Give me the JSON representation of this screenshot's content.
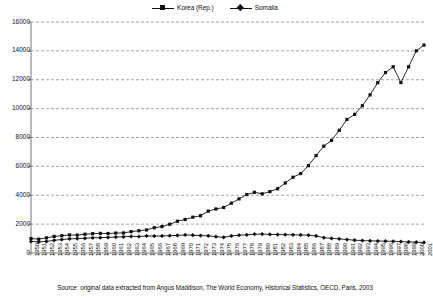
{
  "legend": {
    "position": "top-center",
    "entries": [
      {
        "label": "Korea (Rep.)",
        "marker": "square",
        "color": "#111111"
      },
      {
        "label": "Somalia",
        "marker": "diamond",
        "color": "#111111"
      }
    ]
  },
  "source_note": "Source: original data extracted from Angus Maddison, The World Economy, Historical Statistics, OECD, Paris, 2003",
  "axes": {
    "y_ticks": [
      "0",
      "2000",
      "4000",
      "6000",
      "8000",
      "10000",
      "12000",
      "14000",
      "16000"
    ],
    "x_first": "1950",
    "x_last": "2001"
  },
  "chart_data": {
    "type": "line",
    "title": "",
    "xlabel": "",
    "ylabel": "",
    "ylim": [
      0,
      16000
    ],
    "ytick_step": 2000,
    "grid": true,
    "legend_position": "top-center",
    "x": [
      1950,
      1951,
      1952,
      1953,
      1954,
      1955,
      1956,
      1957,
      1958,
      1959,
      1960,
      1961,
      1962,
      1963,
      1964,
      1965,
      1966,
      1967,
      1968,
      1969,
      1970,
      1971,
      1972,
      1973,
      1974,
      1975,
      1976,
      1977,
      1978,
      1979,
      1980,
      1981,
      1982,
      1983,
      1984,
      1985,
      1986,
      1987,
      1988,
      1989,
      1990,
      1991,
      1992,
      1993,
      1994,
      1995,
      1996,
      1997,
      1998,
      1999,
      2000,
      2001
    ],
    "series": [
      {
        "name": "Korea (Rep.)",
        "marker": "square",
        "color": "#111111",
        "values": [
          1000,
          960,
          1050,
          1150,
          1200,
          1250,
          1240,
          1300,
          1340,
          1360,
          1350,
          1380,
          1390,
          1480,
          1540,
          1600,
          1750,
          1830,
          1990,
          2200,
          2320,
          2480,
          2580,
          2900,
          3050,
          3150,
          3450,
          3750,
          4050,
          4200,
          4100,
          4250,
          4450,
          4850,
          5250,
          5500,
          6050,
          6750,
          7400,
          7800,
          8500,
          9250,
          9600,
          10200,
          10950,
          11800,
          12500,
          12900,
          11800,
          12900,
          14000,
          14400
        ]
      },
      {
        "name": "Somalia",
        "marker": "diamond",
        "color": "#111111",
        "values": [
          800,
          770,
          800,
          880,
          930,
          980,
          1000,
          1020,
          1050,
          1060,
          1080,
          1100,
          1120,
          1150,
          1140,
          1180,
          1170,
          1180,
          1200,
          1220,
          1250,
          1230,
          1210,
          1190,
          1130,
          1090,
          1180,
          1230,
          1260,
          1300,
          1310,
          1290,
          1280,
          1270,
          1260,
          1250,
          1230,
          1180,
          1060,
          1010,
          980,
          930,
          890,
          860,
          840,
          830,
          820,
          810,
          790,
          770,
          750,
          730
        ]
      }
    ]
  }
}
